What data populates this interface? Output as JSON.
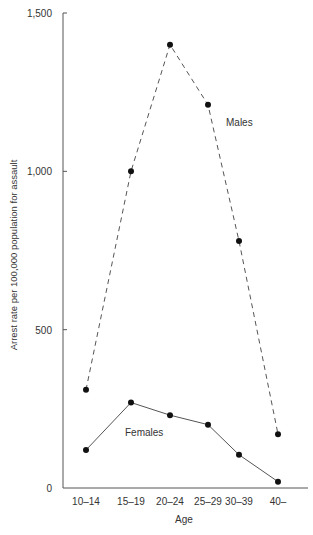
{
  "chart_data": {
    "type": "line",
    "title": "",
    "xlabel": "Age",
    "ylabel": "Arrest rate per 100,000 population for assault",
    "categories": [
      "10–14",
      "15–19",
      "20–24",
      "25–29",
      "30–39",
      "40–"
    ],
    "ylim": [
      0,
      1500
    ],
    "yticks": [
      0,
      500,
      1000,
      1500
    ],
    "ytick_labels": [
      "0",
      "500",
      "1,000",
      "1,500"
    ],
    "grid": false,
    "legend": "inline labels",
    "series": [
      {
        "name": "Males",
        "style": "dashed",
        "values": [
          310,
          1000,
          1400,
          1210,
          780,
          170
        ]
      },
      {
        "name": "Females",
        "style": "solid",
        "values": [
          120,
          270,
          230,
          200,
          105,
          20
        ]
      }
    ]
  }
}
